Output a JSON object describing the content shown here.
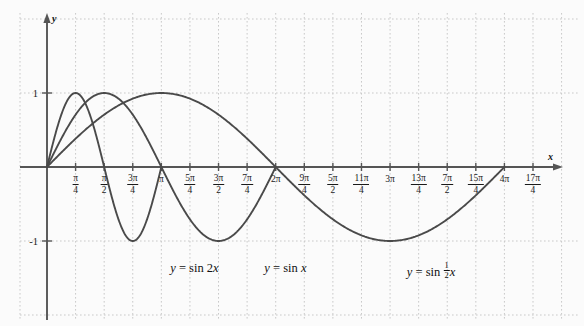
{
  "chart_data": {
    "type": "line",
    "title": "",
    "xlabel": "x",
    "ylabel": "y",
    "xlim": [
      -0.35,
      14.0
    ],
    "ylim": [
      -2.1,
      2.1
    ],
    "grid": true,
    "grid_style": "dotted",
    "legend": "inline-curve-labels",
    "y_ticks": [
      {
        "value": 1,
        "label": "1"
      },
      {
        "value": -1,
        "label": "-1"
      }
    ],
    "x_ticks": [
      {
        "value": 0.7853981634,
        "num": "π",
        "den": "4"
      },
      {
        "value": 1.5707963268,
        "num": "π",
        "den": "2"
      },
      {
        "value": 2.3561944902,
        "num": "3π",
        "den": "4"
      },
      {
        "value": 3.1415926536,
        "whole": "π"
      },
      {
        "value": 3.926990817,
        "num": "5π",
        "den": "4"
      },
      {
        "value": 4.7123889804,
        "num": "3π",
        "den": "2"
      },
      {
        "value": 5.4977871438,
        "num": "7π",
        "den": "4"
      },
      {
        "value": 6.2831853072,
        "whole": "2π"
      },
      {
        "value": 7.0685834706,
        "num": "9π",
        "den": "4"
      },
      {
        "value": 7.853981634,
        "num": "5π",
        "den": "2"
      },
      {
        "value": 8.6393797974,
        "num": "11π",
        "den": "4"
      },
      {
        "value": 9.4247779608,
        "whole": "3π"
      },
      {
        "value": 10.2101761242,
        "num": "13π",
        "den": "4"
      },
      {
        "value": 10.9955742876,
        "num": "7π",
        "den": "2"
      },
      {
        "value": 11.780972451,
        "num": "15π",
        "den": "4"
      },
      {
        "value": 12.5663706144,
        "whole": "4π"
      },
      {
        "value": 13.3517687778,
        "num": "17π",
        "den": "4"
      }
    ],
    "series": [
      {
        "name": "y = sin 2x",
        "formula_lhs": "y",
        "formula_eq": "=",
        "formula_rhs_prefix": "sin",
        "formula_coeff": "2",
        "formula_var": "x",
        "frequency": 2,
        "amplitude": 1,
        "color": "#4a4a4a",
        "label_x": 4.05,
        "label_y": -1.38,
        "zeros": [
          0,
          1.5708,
          3.1416
        ],
        "maxima": [
          {
            "x": 0.7854,
            "y": 1
          }
        ],
        "minima": [
          {
            "x": 2.3562,
            "y": -1
          }
        ]
      },
      {
        "name": "y = sin x",
        "formula_lhs": "y",
        "formula_eq": "=",
        "formula_rhs_prefix": "sin",
        "formula_coeff": "",
        "formula_var": "x",
        "frequency": 1,
        "amplitude": 1,
        "color": "#4a4a4a",
        "label_x": 6.55,
        "label_y": -1.38,
        "zeros": [
          0,
          3.1416,
          6.2832
        ],
        "maxima": [
          {
            "x": 1.5708,
            "y": 1
          }
        ],
        "minima": [
          {
            "x": 4.7124,
            "y": -1
          }
        ]
      },
      {
        "name": "y = sin ½x",
        "formula_lhs": "y",
        "formula_eq": "=",
        "formula_rhs_prefix": "sin",
        "formula_coeff_num": "1",
        "formula_coeff_den": "2",
        "formula_var": "x",
        "frequency": 0.5,
        "amplitude": 1,
        "color": "#4a4a4a",
        "label_x": 10.55,
        "label_y": -1.38,
        "zeros": [
          0,
          6.2832,
          12.5664
        ],
        "maxima": [
          {
            "x": 3.1416,
            "y": 1
          }
        ],
        "minima": [
          {
            "x": 9.4248,
            "y": -1
          }
        ]
      }
    ],
    "colors": {
      "background": "#fbfbfb",
      "axis": "#555555",
      "grid": "#c9c9c9",
      "curve": "#4a4a4a",
      "text": "#1a1a1a",
      "frame": "#d8d8d8"
    }
  }
}
